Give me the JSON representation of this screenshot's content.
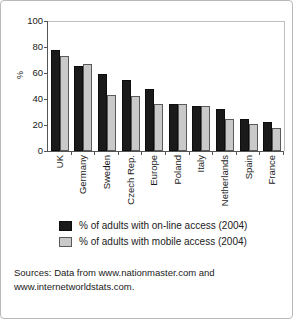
{
  "chart_data": {
    "type": "bar",
    "title": "",
    "xlabel": "",
    "ylabel": "%",
    "ylim": [
      0,
      100
    ],
    "ytick_labels": [
      "100",
      "80",
      "60",
      "40",
      "20",
      "0"
    ],
    "ytick_values": [
      100,
      80,
      60,
      40,
      20,
      0
    ],
    "grid": false,
    "legend_position": "below-plot",
    "categories": [
      "UK",
      "Germany",
      "Sweden",
      "Czech Rep.",
      "Europe",
      "Poland",
      "Italy",
      "Netherlands",
      "Spain",
      "France"
    ],
    "series": [
      {
        "name": "% of adults with on-line access (2004)",
        "color": "#1a1a1a",
        "values": [
          77.5,
          65.5,
          59.5,
          54.5,
          48,
          36.5,
          35,
          32.5,
          25,
          22
        ]
      },
      {
        "name": "% of adults with mobile access (2004)",
        "color": "#c9c9c9",
        "values": [
          73,
          67,
          43,
          42.5,
          36.5,
          36.5,
          35,
          25,
          20.5,
          17.5
        ]
      }
    ]
  },
  "legend": {
    "items": [
      {
        "label": "% of adults with on-line access (2004)",
        "swatch": "online"
      },
      {
        "label": "% of adults with mobile access (2004)",
        "swatch": "mobile"
      }
    ]
  },
  "sources": {
    "line1": "Sources: Data from www.nationmaster.com and",
    "line2": "www.internetworldstats.com."
  }
}
